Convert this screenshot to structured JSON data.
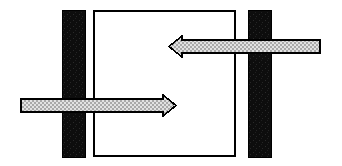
{
  "figure": {
    "canvas": {
      "width": 342,
      "height": 166,
      "background": "#ffffff"
    },
    "colors": {
      "stroke": "#000000",
      "bar_fill": "#111111",
      "box_fill": "#ffffff",
      "arrow_fill": "#c9c9c9",
      "arrow_pattern_light": "#e8e8e8",
      "arrow_pattern_dark": "#9a9a9a",
      "background": "#ffffff"
    },
    "shapes": [
      {
        "name": "left-black-bar",
        "kind": "rect",
        "x": 62,
        "y": 10,
        "width": 23,
        "height": 147,
        "fill": "#111111",
        "stroke": "#000000",
        "stroke_width": 1
      },
      {
        "name": "center-open-box",
        "kind": "rect",
        "x": 93,
        "y": 10,
        "width": 143,
        "height": 147,
        "fill": "#ffffff",
        "stroke": "#000000",
        "stroke_width": 1.6
      },
      {
        "name": "right-black-bar",
        "kind": "rect",
        "x": 248,
        "y": 10,
        "width": 23,
        "height": 147,
        "fill": "#111111",
        "stroke": "#000000",
        "stroke_width": 1
      }
    ],
    "arrows": [
      {
        "name": "upper-arrow-left",
        "direction": "left",
        "tip_x": 169,
        "tail_x": 320,
        "shaft_top": 40,
        "shaft_bottom": 53,
        "head_top": 36,
        "head_bottom": 57,
        "head_base_x": 182,
        "fill": "#c9c9c9",
        "stroke": "#000000",
        "stroke_width": 1.6
      },
      {
        "name": "lower-arrow-right",
        "direction": "right",
        "tip_x": 176,
        "tail_x": 21,
        "shaft_top": 99,
        "shaft_bottom": 112,
        "head_top": 95,
        "head_bottom": 116,
        "head_base_x": 163,
        "fill": "#c9c9c9",
        "stroke": "#000000",
        "stroke_width": 1.6
      }
    ],
    "labels": {
      "left_bar": "left-black-bar",
      "right_bar": "right-black-bar",
      "box": "center-open-box",
      "upper_arrow": "upper-arrow-left",
      "lower_arrow": "lower-arrow-right"
    }
  }
}
